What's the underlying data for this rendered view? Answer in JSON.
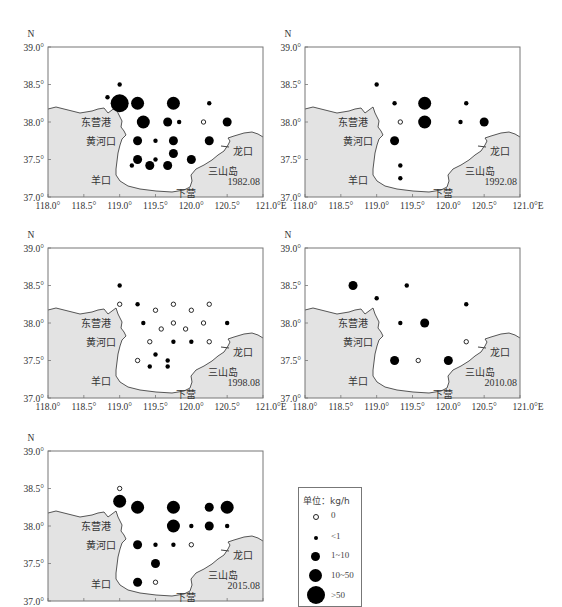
{
  "figure": {
    "axis": {
      "lat_label": "N",
      "lon_suffix": "E",
      "lat_ticks": [
        "39.0°",
        "38.5°",
        "38.0°",
        "37.5°",
        "37.0°"
      ],
      "lon_ticks": [
        "118.0°",
        "118.5°",
        "119.0°",
        "119.5°",
        "120.0°",
        "120.5°",
        "121.0°E"
      ]
    },
    "places": {
      "dongying": "东营港",
      "huanghekou": "黄河口",
      "longkou": "龙口",
      "yangkou": "羊口",
      "sanshandao": "三山岛",
      "xiaying": "下营"
    },
    "legend": {
      "title": "单位：kg/h",
      "items": [
        {
          "label": "0",
          "symbol": "open-circle",
          "size": 4
        },
        {
          "label": "<1",
          "symbol": "dot",
          "size": 4
        },
        {
          "label": "1~10",
          "symbol": "dot",
          "size": 9
        },
        {
          "label": "10~50",
          "symbol": "dot",
          "size": 13
        },
        {
          "label": ">50",
          "symbol": "dot",
          "size": 18
        }
      ]
    }
  },
  "chart_data": [
    {
      "type": "scatter",
      "title": "1982.08",
      "xlabel": "Longitude (°E)",
      "ylabel": "Latitude (°N)",
      "xlim": [
        118.0,
        121.0
      ],
      "ylim": [
        37.0,
        39.0
      ],
      "legend_title": "单位：kg/h",
      "size_classes": [
        "0",
        "<1",
        "1~10",
        "10~50",
        ">50"
      ],
      "points": [
        {
          "lon": 119.0,
          "lat": 38.5,
          "class": "<1"
        },
        {
          "lon": 118.83,
          "lat": 38.33,
          "class": "<1"
        },
        {
          "lon": 119.0,
          "lat": 38.25,
          "class": ">50"
        },
        {
          "lon": 119.25,
          "lat": 38.25,
          "class": "10~50"
        },
        {
          "lon": 119.75,
          "lat": 38.25,
          "class": "10~50"
        },
        {
          "lon": 120.25,
          "lat": 38.25,
          "class": "<1"
        },
        {
          "lon": 119.33,
          "lat": 38.0,
          "class": "10~50"
        },
        {
          "lon": 119.67,
          "lat": 38.0,
          "class": "1~10"
        },
        {
          "lon": 119.83,
          "lat": 38.0,
          "class": "<1"
        },
        {
          "lon": 120.17,
          "lat": 38.0,
          "class": "0"
        },
        {
          "lon": 120.5,
          "lat": 38.0,
          "class": "1~10"
        },
        {
          "lon": 119.25,
          "lat": 37.75,
          "class": "1~10"
        },
        {
          "lon": 119.5,
          "lat": 37.75,
          "class": "<1"
        },
        {
          "lon": 119.75,
          "lat": 37.75,
          "class": "1~10"
        },
        {
          "lon": 120.25,
          "lat": 37.75,
          "class": "1~10"
        },
        {
          "lon": 119.75,
          "lat": 37.58,
          "class": "1~10"
        },
        {
          "lon": 119.25,
          "lat": 37.5,
          "class": "1~10"
        },
        {
          "lon": 119.5,
          "lat": 37.5,
          "class": "<1"
        },
        {
          "lon": 120.0,
          "lat": 37.5,
          "class": "1~10"
        },
        {
          "lon": 119.17,
          "lat": 37.42,
          "class": "<1"
        },
        {
          "lon": 119.42,
          "lat": 37.42,
          "class": "1~10"
        },
        {
          "lon": 119.67,
          "lat": 37.42,
          "class": "1~10"
        }
      ]
    },
    {
      "type": "scatter",
      "title": "1992.08",
      "xlim": [
        118.0,
        121.0
      ],
      "ylim": [
        37.0,
        39.0
      ],
      "points": [
        {
          "lon": 119.0,
          "lat": 38.5,
          "class": "<1"
        },
        {
          "lon": 119.25,
          "lat": 38.25,
          "class": "<1"
        },
        {
          "lon": 119.67,
          "lat": 38.25,
          "class": "10~50"
        },
        {
          "lon": 120.25,
          "lat": 38.25,
          "class": "<1"
        },
        {
          "lon": 119.33,
          "lat": 38.0,
          "class": "0"
        },
        {
          "lon": 119.67,
          "lat": 38.0,
          "class": "10~50"
        },
        {
          "lon": 120.17,
          "lat": 38.0,
          "class": "<1"
        },
        {
          "lon": 120.5,
          "lat": 38.0,
          "class": "1~10"
        },
        {
          "lon": 119.25,
          "lat": 37.75,
          "class": "1~10"
        },
        {
          "lon": 119.33,
          "lat": 37.42,
          "class": "<1"
        },
        {
          "lon": 119.33,
          "lat": 37.25,
          "class": "<1"
        }
      ]
    },
    {
      "type": "scatter",
      "title": "1998.08",
      "xlim": [
        118.0,
        121.0
      ],
      "ylim": [
        37.0,
        39.0
      ],
      "points": [
        {
          "lon": 119.0,
          "lat": 38.5,
          "class": "<1"
        },
        {
          "lon": 119.0,
          "lat": 38.25,
          "class": "0"
        },
        {
          "lon": 119.25,
          "lat": 38.25,
          "class": "<1"
        },
        {
          "lon": 119.5,
          "lat": 38.17,
          "class": "0"
        },
        {
          "lon": 119.75,
          "lat": 38.25,
          "class": "0"
        },
        {
          "lon": 120.0,
          "lat": 38.17,
          "class": "0"
        },
        {
          "lon": 120.25,
          "lat": 38.25,
          "class": "0"
        },
        {
          "lon": 119.33,
          "lat": 38.0,
          "class": "<1"
        },
        {
          "lon": 119.58,
          "lat": 37.92,
          "class": "0"
        },
        {
          "lon": 119.75,
          "lat": 38.0,
          "class": "0"
        },
        {
          "lon": 119.92,
          "lat": 37.92,
          "class": "0"
        },
        {
          "lon": 120.17,
          "lat": 38.0,
          "class": "0"
        },
        {
          "lon": 120.5,
          "lat": 38.0,
          "class": "<1"
        },
        {
          "lon": 119.42,
          "lat": 37.75,
          "class": "0"
        },
        {
          "lon": 119.75,
          "lat": 37.75,
          "class": "<1"
        },
        {
          "lon": 120.0,
          "lat": 37.75,
          "class": "<1"
        },
        {
          "lon": 120.25,
          "lat": 37.75,
          "class": "0"
        },
        {
          "lon": 119.5,
          "lat": 37.58,
          "class": "<1"
        },
        {
          "lon": 119.25,
          "lat": 37.5,
          "class": "0"
        },
        {
          "lon": 119.67,
          "lat": 37.5,
          "class": "<1"
        },
        {
          "lon": 119.42,
          "lat": 37.42,
          "class": "<1"
        },
        {
          "lon": 119.67,
          "lat": 37.42,
          "class": "<1"
        }
      ]
    },
    {
      "type": "scatter",
      "title": "2010.08",
      "xlim": [
        118.0,
        121.0
      ],
      "ylim": [
        37.0,
        39.0
      ],
      "points": [
        {
          "lon": 118.67,
          "lat": 38.5,
          "class": "1~10"
        },
        {
          "lon": 119.42,
          "lat": 38.5,
          "class": "<1"
        },
        {
          "lon": 119.0,
          "lat": 38.33,
          "class": "<1"
        },
        {
          "lon": 120.25,
          "lat": 38.25,
          "class": "<1"
        },
        {
          "lon": 119.33,
          "lat": 38.0,
          "class": "<1"
        },
        {
          "lon": 119.67,
          "lat": 38.0,
          "class": "1~10"
        },
        {
          "lon": 120.25,
          "lat": 37.75,
          "class": "0"
        },
        {
          "lon": 119.25,
          "lat": 37.5,
          "class": "1~10"
        },
        {
          "lon": 119.58,
          "lat": 37.5,
          "class": "0"
        },
        {
          "lon": 120.0,
          "lat": 37.5,
          "class": "1~10"
        }
      ]
    },
    {
      "type": "scatter",
      "title": "2015.08",
      "xlim": [
        118.0,
        121.0
      ],
      "ylim": [
        37.0,
        39.0
      ],
      "points": [
        {
          "lon": 119.0,
          "lat": 38.5,
          "class": "0"
        },
        {
          "lon": 119.0,
          "lat": 38.33,
          "class": "10~50"
        },
        {
          "lon": 119.25,
          "lat": 38.25,
          "class": "10~50"
        },
        {
          "lon": 119.75,
          "lat": 38.25,
          "class": "10~50"
        },
        {
          "lon": 120.25,
          "lat": 38.25,
          "class": "1~10"
        },
        {
          "lon": 120.5,
          "lat": 38.25,
          "class": "10~50"
        },
        {
          "lon": 119.75,
          "lat": 38.0,
          "class": "10~50"
        },
        {
          "lon": 120.0,
          "lat": 38.0,
          "class": "<1"
        },
        {
          "lon": 120.25,
          "lat": 38.0,
          "class": "1~10"
        },
        {
          "lon": 120.5,
          "lat": 38.0,
          "class": "<1"
        },
        {
          "lon": 119.25,
          "lat": 37.75,
          "class": "1~10"
        },
        {
          "lon": 119.5,
          "lat": 37.75,
          "class": "<1"
        },
        {
          "lon": 119.75,
          "lat": 37.75,
          "class": "<1"
        },
        {
          "lon": 120.0,
          "lat": 37.75,
          "class": "0"
        },
        {
          "lon": 119.5,
          "lat": 37.5,
          "class": "1~10"
        },
        {
          "lon": 119.25,
          "lat": 37.25,
          "class": "1~10"
        },
        {
          "lon": 119.5,
          "lat": 37.25,
          "class": "0"
        }
      ]
    }
  ]
}
